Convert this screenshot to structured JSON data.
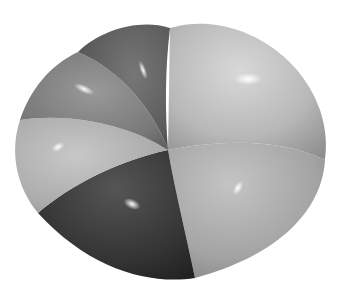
{
  "figure": {
    "segments": [
      {
        "name": "upper-right-lobe",
        "color": "#b9b9b9"
      },
      {
        "name": "lower-right-lobe",
        "color": "#a9a9a9"
      },
      {
        "name": "bottom-dark-lobe",
        "color": "#3a3a3a"
      },
      {
        "name": "left-light-lobe",
        "color": "#b0b0b0"
      },
      {
        "name": "upper-left-lobe",
        "color": "#7a7a7a"
      },
      {
        "name": "top-dark-lobe",
        "color": "#5c5c5c"
      }
    ]
  }
}
